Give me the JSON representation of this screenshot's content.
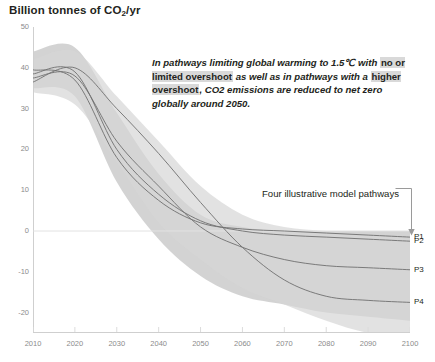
{
  "chart_data": {
    "type": "area",
    "title": "Billion tonnes of CO2/yr",
    "title_prefix": "Billion tonnes of CO",
    "title_sub": "2",
    "title_suffix": "/yr",
    "xlabel": "",
    "ylabel": "Billion tonnes of CO2/yr",
    "xlim": [
      2010,
      2100
    ],
    "ylim": [
      -25,
      50
    ],
    "x_ticks": [
      "2010",
      "2020",
      "2030",
      "2040",
      "2050",
      "2060",
      "2070",
      "2080",
      "2090",
      "2100"
    ],
    "y_ticks": [
      "50",
      "40",
      "30",
      "20",
      "10",
      "0",
      "-10",
      "-20"
    ],
    "grid": false,
    "zero_line": true,
    "legend_position": "right",
    "x": [
      2010,
      2020,
      2030,
      2040,
      2050,
      2060,
      2070,
      2080,
      2090,
      2100
    ],
    "bands": [
      {
        "name": "pathways limiting warming to 1.5C with no or limited overshoot",
        "color": "#c4c4c4",
        "opacity": 0.75,
        "upper": [
          44,
          45,
          29,
          14,
          4,
          1,
          0,
          0,
          0,
          0
        ],
        "lower": [
          35,
          33,
          12,
          -2,
          -11,
          -16,
          -18,
          -20,
          -21,
          -22
        ]
      },
      {
        "name": "pathways with higher overshoot",
        "color": "#d6d6d6",
        "opacity": 0.7,
        "upper": [
          42,
          44,
          33,
          22,
          11,
          4,
          1,
          0,
          -1,
          -2
        ],
        "lower": [
          34,
          31,
          17,
          2,
          -7,
          -14,
          -18,
          -22,
          -25,
          -26
        ]
      }
    ],
    "series": [
      {
        "name": "P1",
        "label": "P1",
        "color": "#6f6f6f",
        "values": [
          39.5,
          37.0,
          18.0,
          7.5,
          2.0,
          0.5,
          0.0,
          -0.5,
          -1.0,
          -1.5
        ]
      },
      {
        "name": "P2",
        "label": "P2",
        "color": "#6f6f6f",
        "values": [
          38.5,
          39.0,
          20.0,
          9.0,
          2.5,
          0.0,
          -1.0,
          -1.5,
          -2.0,
          -2.5
        ]
      },
      {
        "name": "P3",
        "label": "P3",
        "color": "#6f6f6f",
        "values": [
          37.5,
          38.0,
          22.0,
          11.0,
          1.0,
          -4.0,
          -7.0,
          -8.5,
          -9.0,
          -9.5
        ]
      },
      {
        "name": "P4",
        "label": "P4",
        "color": "#6f6f6f",
        "values": [
          36.5,
          40.0,
          30.0,
          19.0,
          7.0,
          -4.0,
          -12.0,
          -16.0,
          -17.0,
          -17.5
        ]
      }
    ],
    "annotations": [
      {
        "name": "net-zero-note",
        "segments": [
          {
            "text": "In pathways limiting global warming to 1.5℃ with ",
            "highlight": false
          },
          {
            "text": "no or limited overshoot",
            "highlight": true
          },
          {
            "text": " as well as in pathways with a ",
            "highlight": false
          },
          {
            "text": "higher overshoot",
            "highlight": true
          },
          {
            "text": ", CO2 emissions are reduced to net zero globally around 2050.",
            "highlight": false
          }
        ]
      }
    ],
    "pathways_caption": "Four illustrative model pathways"
  },
  "colors": {
    "axis": "#cfcfcf",
    "tick_text": "#8b8b8b",
    "text": "#231f20",
    "band_outer": "#d6d6d6",
    "band_inner": "#c4c4c4",
    "line": "#6f6f6f",
    "highlight": "#d9d9d9",
    "bracket": "#9a9a9a"
  }
}
